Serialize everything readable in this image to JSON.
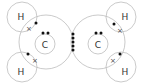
{
  "diagram": {
    "type": "dot-and-cross diagram",
    "molecule_atoms": {
      "carbon_left": {
        "label": "C"
      },
      "carbon_right": {
        "label": "C"
      },
      "hydrogen_top_left": {
        "label": "H"
      },
      "hydrogen_bottom_left": {
        "label": "H"
      },
      "hydrogen_top_right": {
        "label": "H"
      },
      "hydrogen_bottom_right": {
        "label": "H"
      }
    },
    "symbols": {
      "dot": "•",
      "cross": "×"
    },
    "shared_cc_electrons": 5,
    "colors": {
      "ring": "#bdbdbd",
      "electron": "#111111",
      "text": "#333333",
      "background": "#ffffff"
    }
  }
}
